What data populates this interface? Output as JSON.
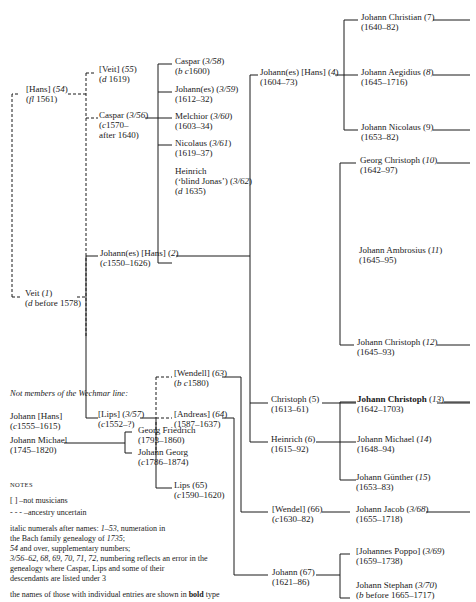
{
  "caption": "",
  "tree": {
    "hans54": {
      "name": "[Hans] (",
      "num": "54",
      "close": ")",
      "dates_pre": "(",
      "dates_i": "fl",
      "dates_post": " 1561)"
    },
    "veit55": {
      "name": "[Veit] (",
      "num": "55",
      "close": ")",
      "dates_pre": "(",
      "dates_i": "d",
      "dates_post": " 1619)"
    },
    "caspar356": {
      "name": "Caspar (",
      "num": "3/56",
      "close": ")",
      "dates_line1_pre": "(",
      "dates_line1_i": "c",
      "dates_line1_post": "1570–",
      "dates_line2": "after 1640)"
    },
    "caspar358": {
      "name": "Caspar (",
      "num": "3/58",
      "close": ")",
      "dates_pre": "(",
      "dates_i": "b c",
      "dates_post": "1600)"
    },
    "johannes359": {
      "name": "Johann(es) (",
      "num": "3/59",
      "close": ")",
      "dates": "(1612–32)"
    },
    "melchior360": {
      "name": "Melchior (",
      "num": "3/60",
      "close": ")",
      "dates": "(1603–34)"
    },
    "nicolaus361": {
      "name": "Nicolaus (",
      "num": "3/61",
      "close": ")",
      "dates": "(1619–37)"
    },
    "heinrich362": {
      "name": "Heinrich",
      "alias": "(‘blind Jonas’) (",
      "num": "3/62",
      "close": ")",
      "dates_pre": "(",
      "dates_i": "d",
      "dates_post": " 1635)"
    },
    "veit1": {
      "name": "Veit (",
      "num": "1",
      "close": ")",
      "dates_pre": "(",
      "dates_i": "d",
      "dates_post": " before 1578)"
    },
    "johannes2": {
      "name": "Johann(es) [Hans] (",
      "num": "2",
      "close": ")",
      "dates_pre": "(",
      "dates_i": "c",
      "dates_post": "1550–1626)"
    },
    "lips357": {
      "name": "[Lips] (",
      "num": "3/57",
      "close": ")",
      "dates_pre": "(",
      "dates_i": "c",
      "dates_post": "1552–?)"
    },
    "wendell63": {
      "name": "[Wendell] (",
      "num": "63",
      "close": ")",
      "dates_pre": "(",
      "dates_i": "b c",
      "dates_post": "1580)"
    },
    "andreas64": {
      "name": "[Andreas] (",
      "num": "64",
      "close": ")",
      "dates": "(1587–1637)"
    },
    "lips65": {
      "name": "Lips (65)",
      "dates_pre": "(",
      "dates_i": "c",
      "dates_post": "1590–1620)"
    },
    "johannes4": {
      "name": "Johann(es) [Hans] (",
      "num": "4",
      "close": ")",
      "dates": "(1604–73)"
    },
    "christoph5": {
      "name": "Christoph (5)",
      "dates": "(1613–61)"
    },
    "heinrich6": {
      "name": "Heinrich (",
      "num": "6",
      "close": ")",
      "dates": "(1615–92)"
    },
    "wendel66": {
      "name": "[Wendel] (66)",
      "dates_pre": "(",
      "dates_i": "c",
      "dates_post": "1630–82)"
    },
    "johann67": {
      "name": "Johann (67)",
      "dates": "(1621–86)"
    },
    "jchristian7": {
      "name": "Johann Christian (7)",
      "dates": "(1640–82)"
    },
    "jaegidius8": {
      "name": "Johann Aegidius (",
      "num": "8",
      "close": ")",
      "dates": "(1645–1716)"
    },
    "jnicolaus9": {
      "name": "Johann Nicolaus (9)",
      "dates": "(1653–82)"
    },
    "gchristoph10": {
      "name": "Georg Christoph (",
      "num": "10",
      "close": ")",
      "dates": "(1642–97)"
    },
    "jambrosius11": {
      "name": "Johann Ambrosius (",
      "num": "11",
      "close": ")",
      "dates": "(1645–95)"
    },
    "jchristoph12": {
      "name": "Johann Christoph (",
      "num": "12",
      "close": ")",
      "dates": "(1645–93)"
    },
    "jchristoph13": {
      "name": "Johann Christoph",
      "num": "13",
      "open": " (",
      "close": ")",
      "dates": "(1642–1703)"
    },
    "jmichael14": {
      "name": "Johann Michael (",
      "num": "14",
      "close": ")",
      "dates": "(1648–94)"
    },
    "jguenther15": {
      "name": "Johann Günther (",
      "num": "15",
      "close": ")",
      "dates": "(1653–83)"
    },
    "jjacob368": {
      "name": "Johann Jacob (",
      "num": "3/68",
      "close": ")",
      "dates": "(1655–1718)"
    },
    "jpoppo369": {
      "name": "[Johannes Poppo] (",
      "num": "3/69",
      "close": ")",
      "dates": "(1659–1738)"
    },
    "jstephan370": {
      "name": "Johann Stephan (",
      "num": "3/70",
      "close": ")",
      "dates_pre": "(",
      "dates_i": "b",
      "dates_post": " before 1665–1717)"
    }
  },
  "nonmembers": {
    "title": "Not members of the Wechmar line:",
    "johann_hans": {
      "name": "Johann [Hans]",
      "dates_pre": "(",
      "dates_i": "c",
      "dates_post": "1555–1615)"
    },
    "johann_michael": {
      "name": "Johann Michael",
      "dates": "(1745–1820)"
    },
    "georg_friedrich": {
      "name": "Georg Friedrich",
      "dates": "(1793–1860)"
    },
    "johann_georg": {
      "name": "Johann Georg",
      "dates_pre": "(",
      "dates_i": "c",
      "dates_post": "1786–1874)"
    }
  },
  "notes": {
    "title": "NOTES",
    "brackets_symbol": "[   ]",
    "brackets_text": "–not musicians",
    "dashes_symbol": "- - -",
    "dashes_text": "–ancestry uncertain",
    "line1_pre": "italic numerals after names: ",
    "line1_i": "1–53",
    "line1_post": ", numeration in",
    "line2_pre": "the Bach family genealogy of ",
    "line2_i": "1735",
    "line2_post": ";",
    "line3_i": "54",
    "line3_post": " and over, supplementary numbers;",
    "line4_i": "3/56–62, 68, 69, 70, 71, 72",
    "line4_post": ", numbering reflects an error in the",
    "line5": "genealogy where Caspar, Lips and some of their",
    "line6": "descendants are listed under 3",
    "line7_pre": "the names of those with individual entries are shown in ",
    "line7_b": "bold",
    "line7_post": " type"
  }
}
